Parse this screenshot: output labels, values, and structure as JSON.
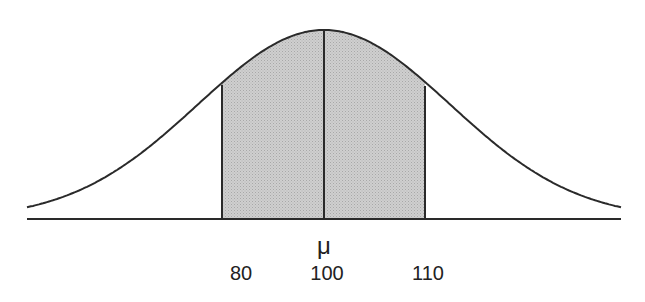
{
  "chart_data": {
    "type": "area",
    "title": "",
    "mean_symbol": "μ",
    "x_ticks": [
      80,
      100,
      110
    ],
    "shaded_range": [
      80,
      110
    ],
    "mean": 100,
    "grid": false,
    "legend": null
  },
  "labels": {
    "mu": "μ",
    "tick_80": "80",
    "tick_100": "100",
    "tick_110": "110"
  },
  "colors": {
    "line": "#2a2a2a",
    "shade": "#c8c8c8",
    "background": "#ffffff"
  }
}
